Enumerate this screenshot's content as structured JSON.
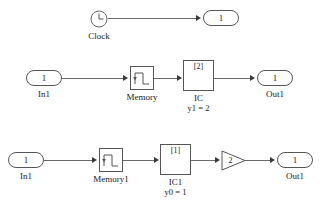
{
  "diagram": {
    "background": "#ffffff",
    "line_color": "#6a6a6a",
    "block_border_color": "#555555",
    "rows": [
      {
        "id": "clock-row",
        "blocks": [
          {
            "name": "clock",
            "icon": "clock-icon",
            "label": "Clock",
            "value": ""
          },
          {
            "name": "outport",
            "icon": "port-icon",
            "label": "",
            "value": "1"
          }
        ]
      },
      {
        "id": "memory-ic-row",
        "blocks": [
          {
            "name": "inport",
            "icon": "port-icon",
            "label": "In1",
            "value": "1"
          },
          {
            "name": "memory",
            "icon": "memory-icon",
            "label": "Memory",
            "value": ""
          },
          {
            "name": "ic",
            "icon": "ic-icon",
            "label": "IC",
            "value": "[2]",
            "sublabel": "y1 = 2"
          },
          {
            "name": "outport",
            "icon": "port-icon",
            "label": "Out1",
            "value": "1"
          }
        ]
      },
      {
        "id": "memory1-ic1-gain-row",
        "blocks": [
          {
            "name": "inport",
            "icon": "port-icon",
            "label": "In1",
            "value": "1"
          },
          {
            "name": "memory1",
            "icon": "memory-icon",
            "label": "Memory1",
            "value": ""
          },
          {
            "name": "ic1",
            "icon": "ic-icon",
            "label": "IC1",
            "value": "[1]",
            "sublabel": "y0 = 1"
          },
          {
            "name": "gain",
            "icon": "gain-triangle-icon",
            "label": "",
            "value": "2"
          },
          {
            "name": "outport",
            "icon": "port-icon",
            "label": "Out1",
            "value": "1"
          }
        ]
      }
    ]
  },
  "labels": {
    "clock": "Clock",
    "clock_out_value": "1",
    "r2_in_value": "1",
    "r2_in_label": "In1",
    "r2_memory_label": "Memory",
    "r2_ic_value": "[2]",
    "r2_ic_label": "IC",
    "r2_ic_sublabel": "y1 = 2",
    "r2_out_value": "1",
    "r2_out_label": "Out1",
    "r3_in_value": "1",
    "r3_in_label": "In1",
    "r3_memory_label": "Memory1",
    "r3_ic_value": "[1]",
    "r3_ic_label": "IC1",
    "r3_ic_sublabel": "y0 = 1",
    "r3_gain_value": "2",
    "r3_out_value": "1",
    "r3_out_label": "Out1"
  }
}
